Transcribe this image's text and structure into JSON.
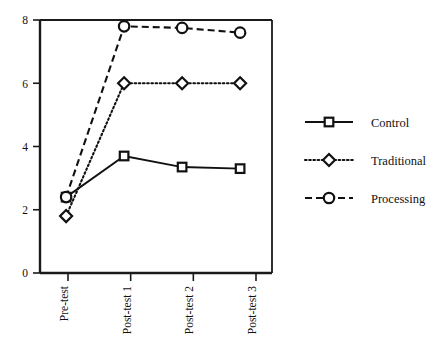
{
  "chart_data": {
    "type": "line",
    "title": "",
    "xlabel": "",
    "ylabel": "",
    "categories": [
      "Pre-test",
      "Post-test 1",
      "Post-test 2",
      "Post-test 3"
    ],
    "ylim": [
      0,
      8
    ],
    "yticks": [
      0,
      2,
      4,
      6,
      8
    ],
    "ytick_labels": [
      "0",
      "2",
      "4",
      "6",
      "8"
    ],
    "grid": false,
    "legend_position": "right",
    "series": [
      {
        "name": "Control",
        "values": [
          2.4,
          3.7,
          3.35,
          3.3
        ],
        "marker": "square",
        "linestyle": "solid",
        "color": "#111111"
      },
      {
        "name": "Traditional",
        "values": [
          1.8,
          6.0,
          6.0,
          6.0
        ],
        "marker": "diamond",
        "linestyle": "dotted",
        "color": "#111111"
      },
      {
        "name": "Processing",
        "values": [
          2.4,
          7.8,
          7.75,
          7.6
        ],
        "marker": "circle",
        "linestyle": "dashed",
        "color": "#111111"
      }
    ]
  },
  "axes": {
    "y_tick_0": "0",
    "y_tick_1": "2",
    "y_tick_2": "4",
    "y_tick_3": "6",
    "y_tick_4": "8",
    "x_tick_0": "Pre-test",
    "x_tick_1": "Post-test 1",
    "x_tick_2": "Post-test 2",
    "x_tick_3": "Post-test 3"
  },
  "legend": {
    "entries": [
      {
        "label": "Control"
      },
      {
        "label": "Traditional"
      },
      {
        "label": "Processing"
      }
    ]
  }
}
